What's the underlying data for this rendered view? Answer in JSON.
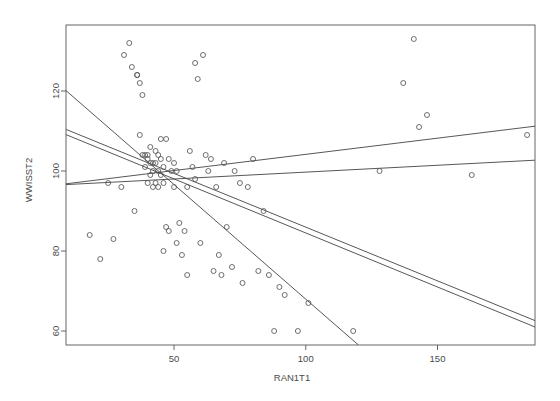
{
  "chart_data": {
    "type": "scatter",
    "title": "",
    "xlabel": "RAN1T1",
    "ylabel": "WWISST2",
    "xlim": [
      9,
      187
    ],
    "ylim": [
      56.5,
      136.5
    ],
    "xticks": [
      50,
      100,
      150
    ],
    "yticks": [
      60,
      80,
      100,
      120
    ],
    "grid": false,
    "legend": "none",
    "point_marker": "open-circle",
    "series": [
      {
        "name": "observations",
        "x": [
          18,
          22,
          25,
          27,
          30,
          31,
          33,
          34,
          35,
          36,
          36,
          37,
          37,
          38,
          38,
          39,
          39,
          40,
          40,
          40,
          41,
          41,
          41,
          42,
          42,
          42,
          43,
          43,
          43,
          44,
          44,
          44,
          45,
          45,
          45,
          46,
          46,
          46,
          47,
          47,
          48,
          48,
          49,
          50,
          50,
          51,
          51,
          52,
          53,
          54,
          55,
          55,
          56,
          57,
          58,
          58,
          59,
          60,
          61,
          62,
          63,
          64,
          65,
          66,
          67,
          68,
          69,
          70,
          72,
          73,
          75,
          76,
          78,
          80,
          82,
          84,
          86,
          88,
          90,
          92,
          97,
          101,
          118,
          128,
          137,
          141,
          143,
          146,
          163,
          184
        ],
        "y": [
          84,
          78,
          97,
          83,
          96,
          129,
          132,
          126,
          90,
          124,
          124,
          109,
          122,
          119,
          104,
          104,
          101,
          104,
          103,
          97,
          106,
          102,
          99,
          102,
          100,
          96,
          105,
          102,
          97,
          104,
          100,
          96,
          108,
          103,
          99,
          101,
          97,
          80,
          108,
          86,
          103,
          85,
          100,
          102,
          96,
          100,
          82,
          87,
          79,
          85,
          96,
          74,
          105,
          101,
          127,
          98,
          123,
          82,
          129,
          104,
          100,
          103,
          75,
          96,
          79,
          74,
          102,
          86,
          76,
          100,
          97,
          72,
          96,
          103,
          75,
          90,
          74,
          60,
          71,
          69,
          60,
          67,
          60,
          100,
          122,
          133,
          111,
          114,
          99,
          109
        ]
      }
    ],
    "regression_lines": [
      {
        "name": "line-1-steep-negative",
        "x0": 9,
        "y0": 120.1,
        "x1": 120,
        "y1": 56.5,
        "slope": -0.573
      },
      {
        "name": "line-2-negative-upper",
        "x0": 9,
        "y0": 110.4,
        "x1": 187,
        "y1": 62.6,
        "slope": -0.268
      },
      {
        "name": "line-3-negative-lower",
        "x0": 9,
        "y0": 109.1,
        "x1": 187,
        "y1": 61.0,
        "slope": -0.27
      },
      {
        "name": "line-4-positive-upper",
        "x0": 9,
        "y0": 96.8,
        "x1": 187,
        "y1": 111.2,
        "slope": 0.081
      },
      {
        "name": "line-5-positive-lower",
        "x0": 9,
        "y0": 96.6,
        "x1": 187,
        "y1": 102.7,
        "slope": 0.034
      }
    ]
  },
  "axes": {
    "x_title": "RAN1T1",
    "y_title": "WWISST2",
    "x_tick_labels": [
      "50",
      "100",
      "150"
    ],
    "y_tick_labels": [
      "60",
      "80",
      "100",
      "120"
    ]
  },
  "style": {
    "axis_color": "#555555",
    "point_color": "#555555",
    "line_color": "#444444",
    "background": "#ffffff"
  }
}
